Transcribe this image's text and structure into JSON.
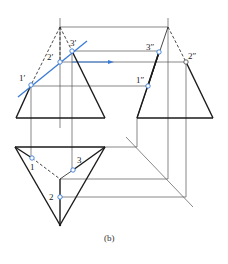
{
  "figure": {
    "caption": "(b)",
    "colors": {
      "outline": "#1a1a1a",
      "projection": "#555555",
      "cut_line": "#3a7bd5",
      "point_fill": "#ffffff",
      "point_stroke": "#3a7bd5",
      "background": "#ffffff"
    }
  },
  "front_view": {
    "points": [
      {
        "label": "1′",
        "x": 31,
        "y": 85,
        "lx": 19,
        "ly": 81
      },
      {
        "label": "2′",
        "x": 60,
        "y": 62,
        "lx": 47,
        "ly": 60
      },
      {
        "label": "3′",
        "x": 72,
        "y": 51,
        "lx": 70,
        "ly": 46
      }
    ]
  },
  "side_view": {
    "points": [
      {
        "label": "3″",
        "x": 159,
        "y": 52,
        "lx": 146,
        "ly": 50
      },
      {
        "label": "2″",
        "x": 186,
        "y": 62,
        "lx": 188,
        "ly": 59
      },
      {
        "label": "1″",
        "x": 148,
        "y": 86,
        "lx": 136,
        "ly": 83
      }
    ]
  },
  "top_view": {
    "points": [
      {
        "label": "1",
        "x": 32,
        "y": 158,
        "lx": 30,
        "ly": 170
      },
      {
        "label": "3",
        "x": 73,
        "y": 170,
        "lx": 77,
        "ly": 163
      },
      {
        "label": "2",
        "x": 60,
        "y": 197,
        "lx": 49,
        "ly": 200
      }
    ]
  }
}
